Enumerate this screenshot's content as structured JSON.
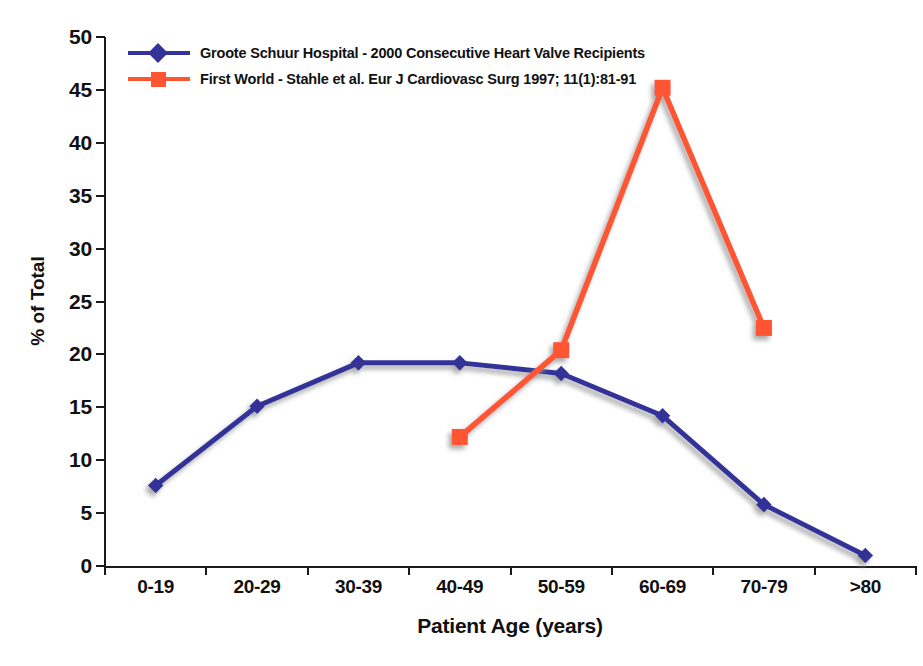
{
  "chart_data": {
    "type": "line",
    "title": "",
    "xlabel": "Patient Age (years)",
    "ylabel": "% of Total",
    "categories": [
      "0-19",
      "20-29",
      "30-39",
      "40-49",
      "50-59",
      "60-69",
      "70-79",
      ">80"
    ],
    "ylim": [
      0,
      50
    ],
    "ytick_step": 5,
    "yticks": [
      0,
      5,
      10,
      15,
      20,
      25,
      30,
      35,
      40,
      45,
      50
    ],
    "grid": false,
    "legend_position": "top-left",
    "series": [
      {
        "name": "Groote Schuur Hospital - 2000 Consecutive Heart Valve Recipients",
        "color": "#333399",
        "marker": "diamond",
        "values": [
          7.6,
          15.1,
          19.2,
          19.2,
          18.2,
          14.2,
          5.8,
          1.0
        ]
      },
      {
        "name": "First World - Stahle et al. Eur J Cardiovasc Surg 1997; 11(1):81-91",
        "color": "#FF5533",
        "marker": "square",
        "values": [
          null,
          null,
          null,
          12.2,
          20.4,
          45.2,
          22.5,
          null
        ]
      }
    ]
  },
  "axes": {
    "y_title": "% of Total",
    "x_title": "Patient Age (years)",
    "y_tick_labels": [
      "50",
      "45",
      "40",
      "35",
      "30",
      "25",
      "20",
      "15",
      "10",
      "5",
      "0"
    ],
    "x_tick_labels": [
      "0-19",
      "20-29",
      "30-39",
      "40-49",
      "50-59",
      "60-69",
      "70-79",
      ">80"
    ]
  },
  "legend": {
    "items": [
      {
        "label": "Groote Schuur Hospital - 2000 Consecutive Heart Valve Recipients",
        "color": "#333399",
        "marker": "diamond"
      },
      {
        "label": "First World - Stahle et al. Eur J Cardiovasc Surg 1997; 11(1):81-91",
        "color": "#FF5533",
        "marker": "square"
      }
    ]
  }
}
